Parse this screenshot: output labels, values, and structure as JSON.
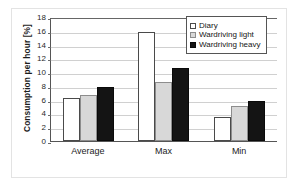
{
  "chart_data": {
    "type": "bar",
    "title": "",
    "xlabel": "",
    "ylabel": "Consumption per hour [%]",
    "categories": [
      "Average",
      "Max",
      "Min"
    ],
    "series": [
      {
        "name": "Diary",
        "values": [
          6.4,
          16.1,
          3.6
        ],
        "color": "#ffffff"
      },
      {
        "name": "Wardriving light",
        "values": [
          6.8,
          8.7,
          5.1
        ],
        "color": "#d8d8d8"
      },
      {
        "name": "Wardriving heavy",
        "values": [
          7.9,
          10.7,
          5.9
        ],
        "color": "#141414"
      }
    ],
    "ylim": [
      0,
      18
    ],
    "yticks": [
      0,
      2,
      4,
      6,
      8,
      10,
      12,
      14,
      16,
      18
    ],
    "ytick_labels": [
      "0",
      "2",
      "4",
      "6",
      "8",
      "10",
      "12",
      "14",
      "16",
      "18"
    ],
    "grid": "horizontal",
    "legend_position": "top-right"
  }
}
